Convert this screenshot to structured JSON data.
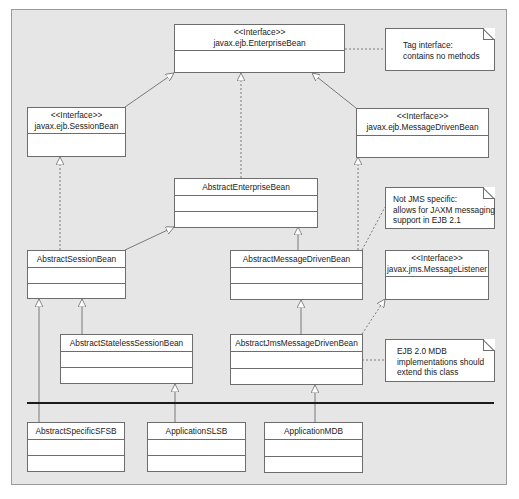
{
  "diagram": {
    "type": "UML class diagram",
    "classes": [
      {
        "id": "enterprise_bean",
        "stereotype": "<<Interface>>",
        "name": "javax.ejb.EnterpriseBean"
      },
      {
        "id": "session_bean",
        "stereotype": "<<Interface>>",
        "name": "javax.ejb.SessionBean"
      },
      {
        "id": "message_driven_bean",
        "stereotype": "<<Interface>>",
        "name": "javax.ejb.MessageDrivenBean"
      },
      {
        "id": "abstract_enterprise_bean",
        "name": "AbstractEnterpriseBean"
      },
      {
        "id": "abstract_session_bean",
        "name": "AbstractSessionBean"
      },
      {
        "id": "abstract_message_driven_bean",
        "name": "AbstractMessageDrivenBean"
      },
      {
        "id": "message_listener",
        "stereotype": "<<Interface>>",
        "name": "javax.jms.MessageListener"
      },
      {
        "id": "abstract_stateless_session_bean",
        "name": "AbstractStatelessSessionBean"
      },
      {
        "id": "abstract_jms_message_driven_bean",
        "name": "AbstractJmsMessageDrivenBean"
      },
      {
        "id": "abstract_specific_sfsb",
        "name": "AbstractSpecificSFSB"
      },
      {
        "id": "application_slsb",
        "name": "ApplicationSLSB"
      },
      {
        "id": "application_mdb",
        "name": "ApplicationMDB"
      }
    ],
    "notes": [
      {
        "id": "tag_note",
        "lines": [
          "Tag interface:",
          "contains no methods"
        ],
        "attached_to": "enterprise_bean"
      },
      {
        "id": "jms_note",
        "lines": [
          "Not JMS specific:",
          "allows for JAXM messaging",
          "support in EJB 2.1"
        ],
        "attached_to": "abstract_message_driven_bean"
      },
      {
        "id": "ejb20_note",
        "lines": [
          "EJB 2.0 MDB",
          "implementations should",
          "extend this class"
        ],
        "attached_to": "abstract_jms_message_driven_bean"
      }
    ],
    "relations": [
      {
        "from": "session_bean",
        "to": "enterprise_bean",
        "kind": "generalization"
      },
      {
        "from": "message_driven_bean",
        "to": "enterprise_bean",
        "kind": "generalization"
      },
      {
        "from": "abstract_enterprise_bean",
        "to": "enterprise_bean",
        "kind": "realization"
      },
      {
        "from": "abstract_session_bean",
        "to": "session_bean",
        "kind": "realization"
      },
      {
        "from": "abstract_session_bean",
        "to": "abstract_enterprise_bean",
        "kind": "generalization"
      },
      {
        "from": "abstract_message_driven_bean",
        "to": "abstract_enterprise_bean",
        "kind": "generalization"
      },
      {
        "from": "abstract_message_driven_bean",
        "to": "message_driven_bean",
        "kind": "realization"
      },
      {
        "from": "abstract_stateless_session_bean",
        "to": "abstract_session_bean",
        "kind": "generalization"
      },
      {
        "from": "abstract_specific_sfsb",
        "to": "abstract_session_bean",
        "kind": "generalization"
      },
      {
        "from": "abstract_jms_message_driven_bean",
        "to": "abstract_message_driven_bean",
        "kind": "generalization"
      },
      {
        "from": "abstract_jms_message_driven_bean",
        "to": "message_listener",
        "kind": "realization"
      },
      {
        "from": "application_slsb",
        "to": "abstract_stateless_session_bean",
        "kind": "generalization"
      },
      {
        "from": "application_mdb",
        "to": "abstract_jms_message_driven_bean",
        "kind": "generalization"
      }
    ],
    "colors": {
      "background": "#e6e6e6",
      "box_fill": "#ffffff",
      "line": "#6d6d6d",
      "layer_separator": "#1a1a1a"
    }
  }
}
